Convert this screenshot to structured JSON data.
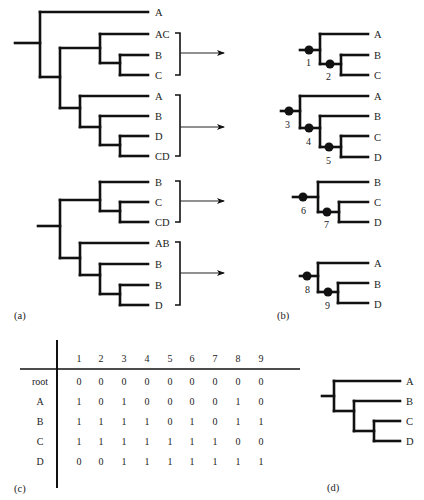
{
  "figure": {
    "panel_labels": {
      "a": "(a)",
      "b": "(b)",
      "c": "(c)",
      "d": "(d)"
    },
    "panel_a": {
      "tree1": {
        "leaves": [
          "A",
          "AC",
          "B",
          "C",
          "A",
          "B",
          "D",
          "CD"
        ]
      },
      "tree2": {
        "leaves": [
          "B",
          "C",
          "CD",
          "AB",
          "B",
          "B",
          "D"
        ]
      }
    },
    "panel_b": {
      "trees": [
        {
          "leaves": [
            "A",
            "B",
            "C"
          ],
          "nodes": [
            "1",
            "2"
          ]
        },
        {
          "leaves": [
            "A",
            "B",
            "C",
            "D"
          ],
          "nodes": [
            "3",
            "4",
            "5"
          ]
        },
        {
          "leaves": [
            "B",
            "C",
            "D"
          ],
          "nodes": [
            "6",
            "7"
          ]
        },
        {
          "leaves": [
            "A",
            "B",
            "D"
          ],
          "nodes": [
            "8",
            "9"
          ]
        }
      ]
    },
    "panel_c": {
      "columns": [
        "1",
        "2",
        "3",
        "4",
        "5",
        "6",
        "7",
        "8",
        "9"
      ],
      "rows": [
        {
          "label": "root",
          "values": [
            "0",
            "0",
            "0",
            "0",
            "0",
            "0",
            "0",
            "0",
            "0"
          ]
        },
        {
          "label": "A",
          "values": [
            "1",
            "0",
            "1",
            "0",
            "0",
            "0",
            "0",
            "1",
            "0"
          ]
        },
        {
          "label": "B",
          "values": [
            "1",
            "1",
            "1",
            "1",
            "0",
            "1",
            "0",
            "1",
            "1"
          ]
        },
        {
          "label": "C",
          "values": [
            "1",
            "1",
            "1",
            "1",
            "1",
            "1",
            "1",
            "0",
            "0"
          ]
        },
        {
          "label": "D",
          "values": [
            "0",
            "0",
            "1",
            "1",
            "1",
            "1",
            "1",
            "1",
            "1"
          ]
        }
      ]
    },
    "panel_d": {
      "leaves": [
        "A",
        "B",
        "C",
        "D"
      ]
    }
  }
}
